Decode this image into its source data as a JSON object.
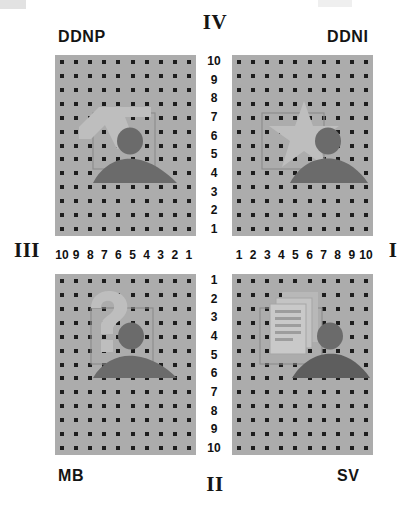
{
  "diagram": {
    "type": "quadrant-grid-stimulus-array",
    "quadrant_labels": {
      "top": "IV",
      "bottom": "II",
      "left": "III",
      "right": "I"
    },
    "panels": [
      {
        "id": "ddnp",
        "name": "DDNP",
        "position": "top-left",
        "quadrant": "IV-III",
        "background_color": "#acacac",
        "dot_color": "#1d1d1d",
        "grid_columns": 10,
        "grid_rows": 13,
        "x_axis": {
          "labels": [
            10,
            9,
            8,
            7,
            6,
            5,
            4,
            3,
            2,
            1
          ],
          "direction": "right-to-left"
        },
        "y_axis": {
          "labels": [
            10,
            9,
            8,
            7,
            6,
            5,
            4,
            3,
            2,
            1
          ],
          "direction": "top-to-bottom"
        },
        "icon_name": "arrow-shape-icon",
        "icon_description": "light gray angular arrow / pointer shape",
        "figure": "person-silhouette",
        "bounding_box_cells": {
          "x": [
            7,
            4
          ],
          "y": [
            7,
            4
          ]
        }
      },
      {
        "id": "ddni",
        "name": "DDNI",
        "position": "top-right",
        "quadrant": "IV-I",
        "background_color": "#acacac",
        "dot_color": "#1d1d1d",
        "grid_columns": 10,
        "grid_rows": 13,
        "x_axis": {
          "labels": [
            1,
            2,
            3,
            4,
            5,
            6,
            7,
            8,
            9,
            10
          ],
          "direction": "left-to-right"
        },
        "y_axis": {
          "labels": [
            10,
            9,
            8,
            7,
            6,
            5,
            4,
            3,
            2,
            1
          ],
          "direction": "top-to-bottom"
        },
        "icon_name": "star-shape-icon",
        "icon_description": "light gray five-pointed star shape",
        "figure": "person-silhouette",
        "bounding_box_cells": {
          "x": [
            4,
            7
          ],
          "y": [
            7,
            4
          ]
        }
      },
      {
        "id": "mb",
        "name": "MB",
        "position": "bottom-left",
        "quadrant": "II-III",
        "background_color": "#acacac",
        "dot_color": "#1d1d1d",
        "grid_columns": 10,
        "grid_rows": 13,
        "x_axis": {
          "labels": [
            10,
            9,
            8,
            7,
            6,
            5,
            4,
            3,
            2,
            1
          ],
          "direction": "right-to-left"
        },
        "y_axis": {
          "labels": [
            1,
            2,
            3,
            4,
            5,
            6,
            7,
            8,
            9,
            10
          ],
          "direction": "top-to-bottom"
        },
        "icon_name": "question-mark-icon",
        "icon_description": "light gray question mark glyph",
        "figure": "person-silhouette",
        "bounding_box_cells": {
          "x": [
            7,
            4
          ],
          "y": [
            3,
            6
          ]
        }
      },
      {
        "id": "sv",
        "name": "SV",
        "position": "bottom-right",
        "quadrant": "II-I",
        "background_color": "#acacac",
        "dot_color": "#1d1d1d",
        "grid_columns": 10,
        "grid_rows": 13,
        "x_axis": {
          "labels": [
            1,
            2,
            3,
            4,
            5,
            6,
            7,
            8,
            9,
            10
          ],
          "direction": "left-to-right"
        },
        "y_axis": {
          "labels": [
            1,
            2,
            3,
            4,
            5,
            6,
            7,
            8,
            9,
            10
          ],
          "direction": "top-to-bottom"
        },
        "icon_name": "documents-stack-icon",
        "icon_description": "light gray stacked documents / papers shape",
        "figure": "person-silhouette",
        "bounding_box_cells": {
          "x": [
            4,
            7
          ],
          "y": [
            3,
            6
          ]
        }
      }
    ],
    "axis_scales": {
      "vertical_top": [
        10,
        9,
        8,
        7,
        6,
        5,
        4,
        3,
        2,
        1
      ],
      "vertical_bottom": [
        1,
        2,
        3,
        4,
        5,
        6,
        7,
        8,
        9,
        10
      ],
      "horizontal_left": [
        10,
        9,
        8,
        7,
        6,
        5,
        4,
        3,
        2,
        1
      ],
      "horizontal_right": [
        1,
        2,
        3,
        4,
        5,
        6,
        7,
        8,
        9,
        10
      ]
    },
    "colors": {
      "panel_background": "#acacac",
      "dot": "#1d1d1d",
      "figure_dark": "#6e6e6e",
      "icon_light": "#c2c2c2",
      "text": "#141414",
      "page_background": "#ffffff"
    }
  }
}
